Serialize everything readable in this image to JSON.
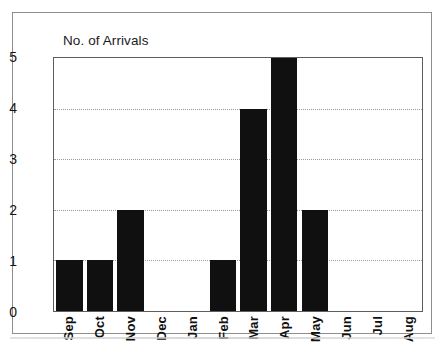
{
  "chart_data": {
    "type": "bar",
    "title": "No. of Arrivals",
    "xlabel": "",
    "ylabel": "",
    "categories": [
      "Sep",
      "Oct",
      "Nov",
      "Dec",
      "Jan",
      "Feb",
      "Mar",
      "Apr",
      "May",
      "Jun",
      "Jul",
      "Aug"
    ],
    "values": [
      1,
      1,
      2,
      0,
      0,
      1,
      4,
      5,
      2,
      0,
      0,
      0
    ],
    "ylim": [
      0,
      5
    ],
    "yticks": [
      "0",
      "1",
      "2",
      "3",
      "4",
      "5"
    ],
    "grid": "horizontal-dotted",
    "legend": "none",
    "bar_color": "#101010",
    "axis_color": "#5e5e5e",
    "grid_color": "#9a9a9a",
    "frame_color": "#8d8d8d"
  }
}
